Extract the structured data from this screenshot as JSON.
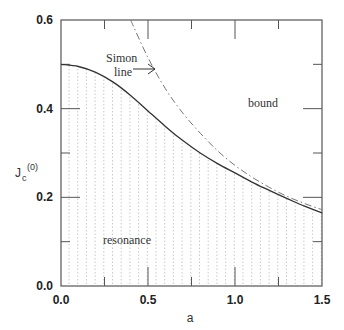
{
  "chart_data": {
    "type": "line",
    "title": "",
    "xlabel": "a",
    "ylabel": "J_c^(0)",
    "ylabel_main": "J",
    "ylabel_sub": "c",
    "ylabel_sup": "(0)",
    "xlim": [
      0.0,
      1.5
    ],
    "ylim": [
      0.0,
      0.6
    ],
    "xticks": [
      "0.0",
      "0.5",
      "1.0",
      "1.5"
    ],
    "yticks": [
      "0.0",
      "0.2",
      "0.4",
      "0.6"
    ],
    "grid": false,
    "series": [
      {
        "name": "critical coupling (solid)",
        "style": "solid",
        "x": [
          0.0,
          0.1,
          0.2,
          0.3,
          0.4,
          0.5,
          0.6,
          0.7,
          0.8,
          0.9,
          1.0,
          1.1,
          1.2,
          1.3,
          1.4,
          1.5
        ],
        "y": [
          0.5,
          0.495,
          0.482,
          0.46,
          0.43,
          0.395,
          0.36,
          0.328,
          0.3,
          0.276,
          0.255,
          0.234,
          0.215,
          0.197,
          0.18,
          0.165
        ]
      },
      {
        "name": "Simon line (dash-dot)",
        "style": "dashdot",
        "x": [
          0.4,
          0.5,
          0.6,
          0.7,
          0.8,
          0.9,
          1.0,
          1.1,
          1.2,
          1.3,
          1.4,
          1.5
        ],
        "y": [
          0.6,
          0.515,
          0.445,
          0.39,
          0.345,
          0.305,
          0.272,
          0.245,
          0.222,
          0.202,
          0.186,
          0.172
        ]
      }
    ],
    "regions": [
      {
        "name": "resonance",
        "fill": "dotted vertical hatching below solid curve"
      },
      {
        "name": "bound",
        "fill": "none"
      }
    ],
    "annotations": [
      {
        "text": "Simon",
        "x": 0.28,
        "y": 0.515
      },
      {
        "text": "line",
        "x": 0.33,
        "y": 0.485
      },
      {
        "text": "bound",
        "x": 1.1,
        "y": 0.43
      },
      {
        "text": "resonance",
        "x": 0.4,
        "y": 0.1
      }
    ]
  },
  "labels": {
    "simon_1": "Simon",
    "simon_2": "line",
    "bound": "bound",
    "resonance": "resonance",
    "x_axis": "a",
    "y_axis_main": "J",
    "y_axis_sub": "c",
    "y_axis_sup": "(0)",
    "xt0": "0.0",
    "xt1": "0.5",
    "xt2": "1.0",
    "xt3": "1.5",
    "yt0": "0.0",
    "yt1": "0.2",
    "yt2": "0.4",
    "yt3": "0.6"
  }
}
